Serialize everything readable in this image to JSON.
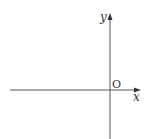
{
  "diagram": {
    "type": "coordinate-axes",
    "axes": {
      "x_label": "x",
      "y_label": "y",
      "origin_label": "O"
    },
    "colors": {
      "axis": "#444444",
      "text": "#333333",
      "background": "#ffffff"
    }
  }
}
